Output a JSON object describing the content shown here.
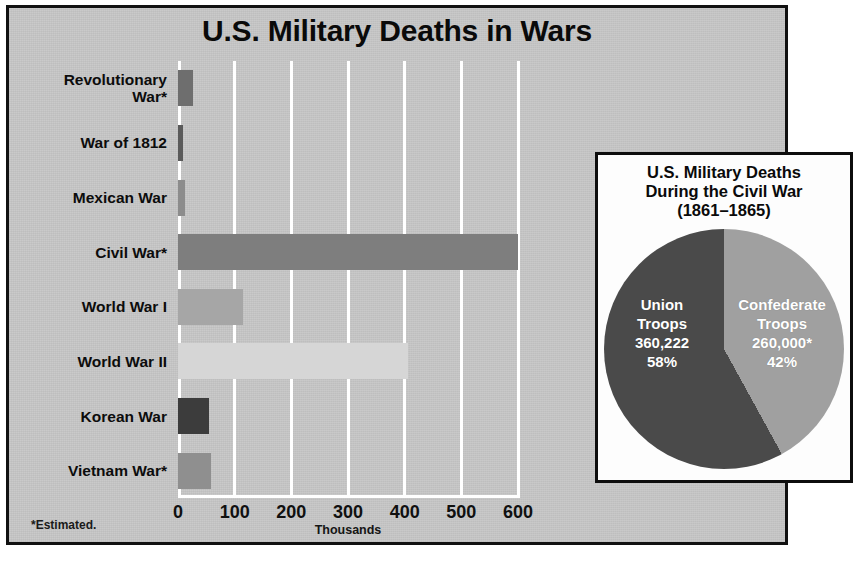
{
  "figure": {
    "title": "U.S. Military Deaths in Wars",
    "footnote": "*Estimated.",
    "background_color": "#c8c8c8",
    "frame_color": "#111111"
  },
  "chart_data": {
    "type": "bar",
    "orientation": "horizontal",
    "title": "U.S. Military Deaths in Wars",
    "xlabel": "Thousands",
    "ylabel": "",
    "xlim": [
      0,
      600
    ],
    "xticks": [
      0,
      100,
      200,
      300,
      400,
      500,
      600
    ],
    "xtick_labels": [
      "0",
      "100",
      "200",
      "300",
      "400",
      "500",
      "600"
    ],
    "grid": true,
    "grid_color": "#ffffff",
    "units": "thousands",
    "categories": [
      "Revolutionary\nWar*",
      "War of 1812",
      "Mexican War",
      "Civil  War*",
      "World War I",
      "World War II",
      "Korean War",
      "Vietnam War*"
    ],
    "values": [
      27,
      8,
      13,
      620,
      115,
      405,
      54,
      58
    ],
    "bar_colors": [
      "#6e6e6e",
      "#5a5a5a",
      "#8c8c8c",
      "#7e7e7e",
      "#a6a6a6",
      "#d6d6d6",
      "#3c3c3c",
      "#8f8f8f"
    ]
  },
  "inset": {
    "title": "U.S. Military Deaths\nDuring the Civil War\n(1861–1865)",
    "title_lines": [
      "U.S. Military Deaths",
      "During the Civil War",
      "(1861–1865)"
    ],
    "chart_data": {
      "type": "pie",
      "title": "U.S. Military Deaths During the Civil War (1861–1865)",
      "labels": [
        "Union Troops",
        "Confederate Troops"
      ],
      "values": [
        360222,
        260000
      ],
      "percents": [
        58,
        42
      ],
      "value_labels": [
        "360,222",
        "260,000*"
      ],
      "percent_labels": [
        "58%",
        "42%"
      ],
      "colors": [
        "#4a4a4a",
        "#a0a0a0"
      ],
      "legend": "in-slice"
    },
    "slices": [
      {
        "name": "Union Troops",
        "line1": "Union",
        "line2": "Troops",
        "value": "360,222",
        "percent": "58%",
        "color": "#4a4a4a"
      },
      {
        "name": "Confederate Troops",
        "line1": "Confederate",
        "line2": "Troops",
        "value": "260,000*",
        "percent": "42%",
        "color": "#a0a0a0"
      }
    ]
  }
}
